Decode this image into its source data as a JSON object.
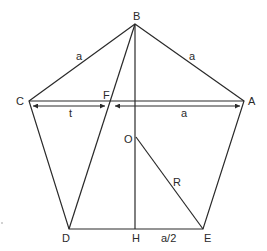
{
  "diagram": {
    "colors": {
      "stroke": "#2a2a2a",
      "text": "#2a2a2a",
      "background": "#ffffff"
    },
    "points": {
      "A": {
        "label": "A"
      },
      "B": {
        "label": "B"
      },
      "C": {
        "label": "C"
      },
      "D": {
        "label": "D"
      },
      "E": {
        "label": "E"
      },
      "F": {
        "label": "F"
      },
      "O": {
        "label": "O"
      },
      "H": {
        "label": "H"
      }
    },
    "dimensions": {
      "side_BC": "a",
      "side_BA": "a",
      "segment_CF": "t",
      "segment_FA": "a",
      "radius_OE": "R",
      "segment_HE": "a/2"
    }
  }
}
